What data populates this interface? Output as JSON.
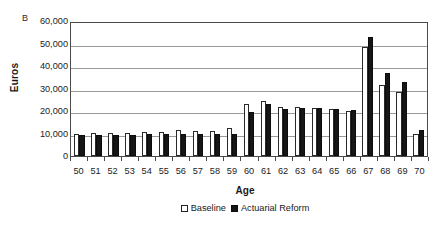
{
  "panel": {
    "label": "B"
  },
  "axes": {
    "ylabel": "Euros",
    "xlabel": "Age",
    "yticks": [
      "60,000",
      "50,000",
      "40,000",
      "30,000",
      "20,000",
      "10,000",
      "0"
    ]
  },
  "legend": {
    "items": [
      {
        "label": "Baseline",
        "swatch": "open-square-icon",
        "color": "#ffffff"
      },
      {
        "label": "Actuarial Reform",
        "swatch": "filled-square-icon",
        "color": "#161616"
      }
    ]
  },
  "chart_data": {
    "type": "bar",
    "title": "B",
    "xlabel": "Age",
    "ylabel": "Euros",
    "ylim": [
      0,
      60000
    ],
    "ytick_step": 10000,
    "grid": true,
    "legend_position": "bottom-center",
    "categories": [
      "50",
      "51",
      "52",
      "53",
      "54",
      "55",
      "56",
      "57",
      "58",
      "59",
      "60",
      "61",
      "62",
      "63",
      "64",
      "65",
      "66",
      "67",
      "68",
      "69",
      "70"
    ],
    "series": [
      {
        "name": "Baseline",
        "color": "#ffffff",
        "values": [
          10000,
          10100,
          10200,
          10300,
          10500,
          10600,
          11700,
          11300,
          11300,
          12400,
          23000,
          24600,
          21800,
          21700,
          21300,
          21000,
          19900,
          48500,
          31600,
          28500,
          9800
        ]
      },
      {
        "name": "Actuarial Reform",
        "color": "#161616",
        "values": [
          9200,
          9300,
          9400,
          9500,
          9700,
          9800,
          9900,
          9900,
          9900,
          9900,
          19400,
          23100,
          21000,
          21300,
          21200,
          21000,
          20300,
          53000,
          36800,
          33000,
          11500
        ]
      }
    ]
  }
}
